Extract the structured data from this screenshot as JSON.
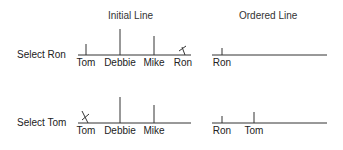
{
  "titles": {
    "initial": "Initial Line",
    "ordered": "Ordered Line"
  },
  "rows": [
    {
      "label": "Select Ron",
      "initial": [
        {
          "name": "Tom",
          "height": 11,
          "removed": false
        },
        {
          "name": "Debbie",
          "height": 26,
          "removed": false
        },
        {
          "name": "Mike",
          "height": 19,
          "removed": false
        },
        {
          "name": "Ron",
          "height": 8,
          "removed": true
        }
      ],
      "ordered": [
        {
          "name": "Ron",
          "height": 7
        }
      ]
    },
    {
      "label": "Select Tom",
      "initial": [
        {
          "name": "Tom",
          "height": 12,
          "removed": true
        },
        {
          "name": "Debbie",
          "height": 26,
          "removed": false
        },
        {
          "name": "Mike",
          "height": 18,
          "removed": false
        }
      ],
      "ordered": [
        {
          "name": "Ron",
          "height": 7
        },
        {
          "name": "Tom",
          "height": 11
        }
      ]
    }
  ],
  "colors": {
    "line": "#333333",
    "text": "#222222"
  }
}
